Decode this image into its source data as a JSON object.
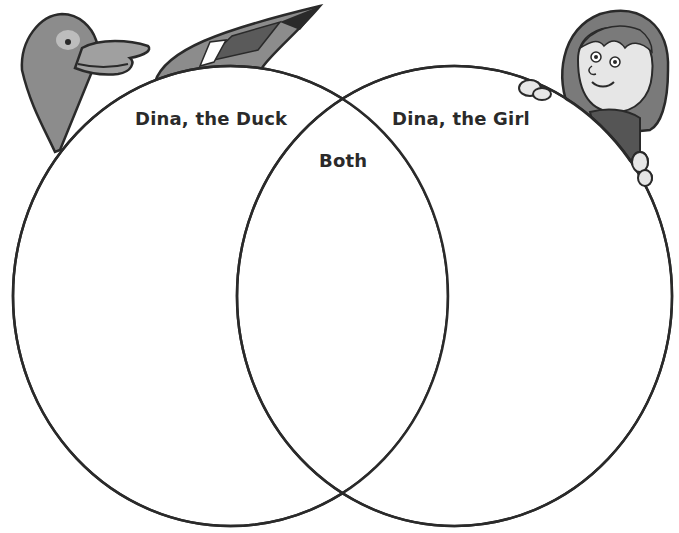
{
  "diagram": {
    "type": "venn",
    "sets": [
      {
        "label": "Dina, the Duck"
      },
      {
        "label": "Dina, the Girl"
      }
    ],
    "intersection_label": "Both"
  },
  "illustrations": {
    "left": "duck-illustration",
    "right": "girl-illustration"
  },
  "colors": {
    "outline": "#2a2a2a",
    "duck_body": "#8c8c8c",
    "girl_hair": "#7a7a7a",
    "girl_shirt": "#555555",
    "skin": "#dcdcdc"
  }
}
